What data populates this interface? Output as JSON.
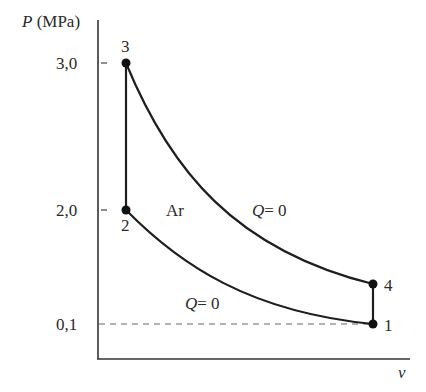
{
  "diagram": {
    "type": "P-v diagram",
    "y_axis": {
      "symbol": "P",
      "unit": "(MPa)",
      "ticks": [
        "3,0",
        "2,0",
        "0,1"
      ]
    },
    "x_axis": {
      "symbol": "v"
    },
    "gas_label": "Ar",
    "states": [
      {
        "id": "1",
        "label": "1"
      },
      {
        "id": "2",
        "label": "2"
      },
      {
        "id": "3",
        "label": "3"
      },
      {
        "id": "4",
        "label": "4"
      }
    ],
    "process_labels": {
      "upper": {
        "q": "Q",
        "rest": "= 0"
      },
      "lower": {
        "q": "Q",
        "rest": "= 0"
      }
    },
    "colors": {
      "line": "#1e1e1e",
      "dashed": "#555555",
      "axis": "#333333"
    }
  }
}
